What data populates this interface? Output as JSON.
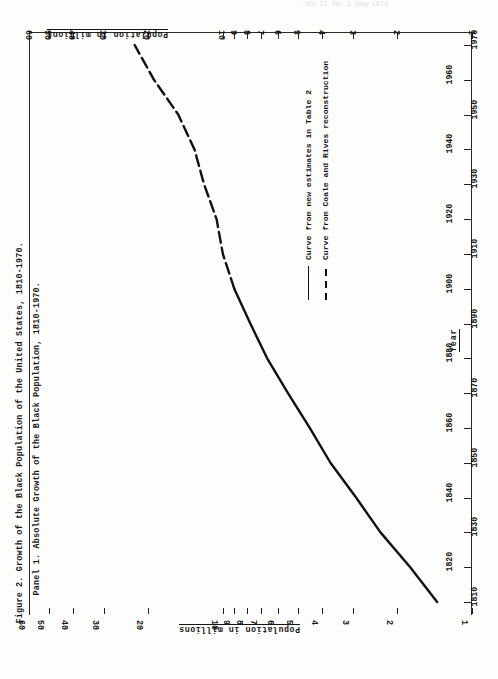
{
  "scan": {
    "header_smudge": ", Vol. 21, No. 3, May 1974"
  },
  "figure": {
    "title": "Figure 2.  Growth of the Black Population of the United States, 1810-1970.",
    "panel": "Panel 1.  Absolute Growth of the Black Population, 1810-1970."
  },
  "legend": {
    "position": "center-right",
    "items": [
      {
        "style": "solid",
        "label": "Curve from new estimates in Table 2"
      },
      {
        "style": "dashed",
        "label": "Curve from Coale and Rives reconstruction"
      }
    ]
  },
  "chart_data": {
    "type": "line",
    "title": "Growth of the Black Population of the United States, 1810-1970",
    "subtitle": "Panel 1. Absolute Growth of the Black Population, 1810-1970",
    "orientation": "rotated-90-landscape",
    "xlabel": "Year",
    "ylabel": "Population in millions",
    "yscale": "log",
    "ylim": [
      1,
      60
    ],
    "xlim": [
      1810,
      1970
    ],
    "grid": false,
    "x_ticks": [
      1810,
      1820,
      1830,
      1840,
      1850,
      1860,
      1870,
      1880,
      1890,
      1900,
      1910,
      1920,
      1930,
      1940,
      1950,
      1960,
      1970
    ],
    "y_ticks": [
      1,
      2,
      3,
      4,
      5,
      6,
      7,
      8,
      9,
      10,
      20,
      30,
      40,
      50,
      60
    ],
    "y_tick_labels": [
      "1",
      "2",
      "3",
      "4",
      "5",
      "6",
      "7",
      "8",
      "9",
      "10",
      "20",
      "30",
      "40",
      "50",
      "60"
    ],
    "series": [
      {
        "name": "Curve from new estimates in Table 2",
        "style": "solid",
        "x": [
          1810,
          1820,
          1830,
          1840,
          1850,
          1860,
          1870,
          1880,
          1890,
          1900
        ],
        "values": [
          1.38,
          1.77,
          2.33,
          2.92,
          3.7,
          4.48,
          5.48,
          6.64,
          7.76,
          9.0
        ]
      },
      {
        "name": "Curve from Coale and Rives reconstruction",
        "style": "dashed",
        "x": [
          1900,
          1910,
          1920,
          1930,
          1940,
          1950,
          1960,
          1970
        ],
        "values": [
          9.0,
          10.0,
          10.6,
          11.9,
          13.0,
          15.1,
          18.9,
          22.6
        ]
      }
    ]
  }
}
